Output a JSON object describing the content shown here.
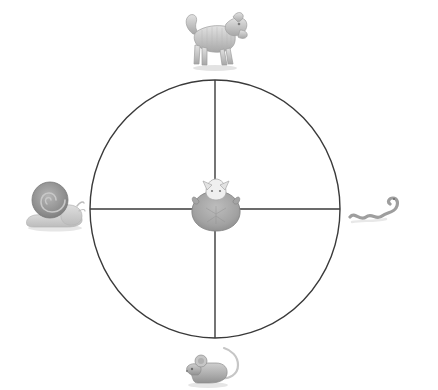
{
  "scene": {
    "title": "Animal speed wheel diagram",
    "background_color": "#ffffff",
    "width": 438,
    "height": 390
  },
  "wheel": {
    "name": "quadrant-circle",
    "center": {
      "x": 215,
      "y": 209
    },
    "radius_x": 125,
    "radius_y": 129,
    "stroke_color": "#3a3a3a",
    "stroke_width": 1.4,
    "axes": [
      {
        "label": "vertical-axis",
        "orientation": "vertical"
      },
      {
        "label": "horizontal-axis",
        "orientation": "horizontal"
      }
    ]
  },
  "figures": [
    {
      "id": "dog",
      "label": "dog",
      "position": "top",
      "color": "#b9b9b9",
      "shadow_color": "#d8d8d8",
      "center": {
        "x": 214,
        "y": 39
      }
    },
    {
      "id": "snail",
      "label": "snail",
      "position": "left",
      "color": "#9a9a9a",
      "shadow_color": "#d8d8d8",
      "center": {
        "x": 55,
        "y": 207
      }
    },
    {
      "id": "snake",
      "label": "snake",
      "position": "right",
      "color": "#9e9e9e",
      "shadow_color": "#dcdcdc",
      "center": {
        "x": 378,
        "y": 212
      }
    },
    {
      "id": "mouse",
      "label": "mouse",
      "position": "bottom",
      "color": "#a8a8a8",
      "shadow_color": "#dcdcdc",
      "center": {
        "x": 220,
        "y": 367
      }
    },
    {
      "id": "cat",
      "label": "cat",
      "position": "center",
      "color": "#a9a9a9",
      "shadow_color": "#cfcfcf",
      "center": {
        "x": 216,
        "y": 207
      }
    }
  ]
}
